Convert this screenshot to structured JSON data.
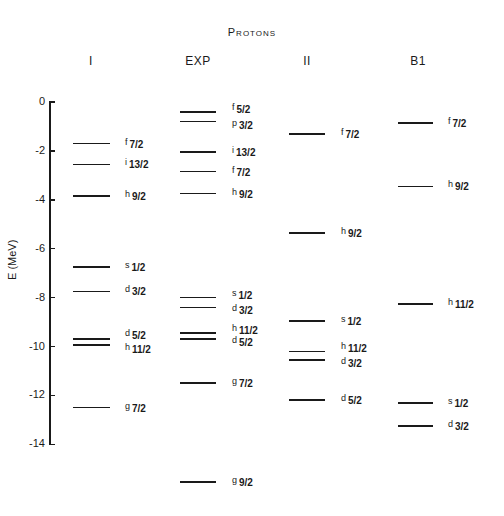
{
  "chart_data": {
    "type": "energy-level-diagram",
    "title": "Protons",
    "ylabel": "E (MeV)",
    "ylim": [
      -14,
      0
    ],
    "yticks": [
      0,
      -2,
      -4,
      -6,
      -8,
      -10,
      -12,
      -14
    ],
    "columns": [
      {
        "name": "I",
        "levels": [
          {
            "state": "f",
            "j": "7/2",
            "energy": -1.7
          },
          {
            "state": "i",
            "j": "13/2",
            "energy": -2.55
          },
          {
            "state": "h",
            "j": "9/2",
            "energy": -3.85
          },
          {
            "state": "s",
            "j": "1/2",
            "energy": -6.75
          },
          {
            "state": "d",
            "j": "3/2",
            "energy": -7.75
          },
          {
            "state": "d",
            "j": "5/2",
            "energy": -9.7
          },
          {
            "state": "h",
            "j": "11/2",
            "energy": -9.95
          },
          {
            "state": "g",
            "j": "7/2",
            "energy": -12.5
          }
        ]
      },
      {
        "name": "EXP",
        "levels": [
          {
            "state": "f",
            "j": "5/2",
            "energy": -0.4
          },
          {
            "state": "p",
            "j": "3/2",
            "energy": -0.8
          },
          {
            "state": "i",
            "j": "13/2",
            "energy": -2.05
          },
          {
            "state": "f",
            "j": "7/2",
            "energy": -2.85
          },
          {
            "state": "h",
            "j": "9/2",
            "energy": -3.75
          },
          {
            "state": "s",
            "j": "1/2",
            "energy": -8.0
          },
          {
            "state": "d",
            "j": "3/2",
            "energy": -8.4
          },
          {
            "state": "h",
            "j": "11/2",
            "energy": -9.45
          },
          {
            "state": "d",
            "j": "5/2",
            "energy": -9.7
          },
          {
            "state": "g",
            "j": "7/2",
            "energy": -11.5
          },
          {
            "state": "g",
            "j": "9/2",
            "energy": -15.55
          }
        ]
      },
      {
        "name": "II",
        "levels": [
          {
            "state": "f",
            "j": "7/2",
            "energy": -1.3
          },
          {
            "state": "h",
            "j": "9/2",
            "energy": -5.35
          },
          {
            "state": "s",
            "j": "1/2",
            "energy": -8.95
          },
          {
            "state": "h",
            "j": "11/2",
            "energy": -10.2
          },
          {
            "state": "d",
            "j": "3/2",
            "energy": -10.55
          },
          {
            "state": "d",
            "j": "5/2",
            "energy": -12.2
          }
        ]
      },
      {
        "name": "B1",
        "levels": [
          {
            "state": "f",
            "j": "7/2",
            "energy": -0.85
          },
          {
            "state": "h",
            "j": "9/2",
            "energy": -3.45
          },
          {
            "state": "h",
            "j": "11/2",
            "energy": -8.25
          },
          {
            "state": "s",
            "j": "1/2",
            "energy": -12.3
          },
          {
            "state": "d",
            "j": "3/2",
            "energy": -13.25
          }
        ]
      }
    ]
  },
  "layout": {
    "y0_px": 102,
    "px_per_mev": 24.45,
    "columns": [
      {
        "line_x": 73,
        "line_w": 37,
        "label_x": 125,
        "head_x": 91,
        "label_dy": [
          0,
          0,
          0,
          0,
          0,
          -4,
          4,
          0
        ]
      },
      {
        "line_x": 180,
        "line_w": 36,
        "label_x": 232,
        "head_x": 198,
        "label_dy": [
          -3,
          3,
          0,
          0,
          0,
          -3,
          3,
          -3,
          3,
          0,
          0
        ]
      },
      {
        "line_x": 289,
        "line_w": 36,
        "label_x": 341,
        "head_x": 307,
        "label_dy": [
          0,
          0,
          0,
          -3,
          3,
          0
        ]
      },
      {
        "line_x": 398,
        "line_w": 35,
        "label_x": 448,
        "head_x": 418,
        "label_dy": [
          0,
          0,
          0,
          0,
          0
        ]
      }
    ]
  }
}
